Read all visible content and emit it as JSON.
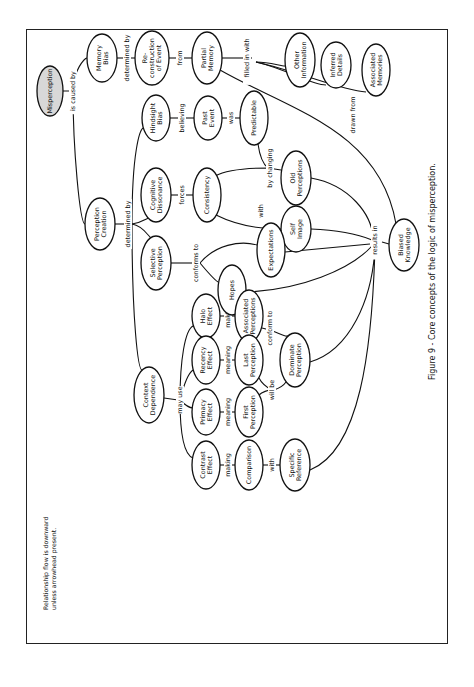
{
  "figure": {
    "caption": "Figure 9 - Core concepts of the logic of misperception.",
    "note_line1": "Relationship flow is downward",
    "note_line2": "unless arrowhead present."
  },
  "colors": {
    "stroke": "#111111",
    "root_fill": "#d8d8d8",
    "node_fill": "#ffffff"
  },
  "nodes": [
    {
      "id": "misperception",
      "lines": [
        "Misperception"
      ],
      "x": 50,
      "y": 91,
      "rx": 13,
      "ry": 25,
      "shaded": true
    },
    {
      "id": "memory-bias",
      "lines": [
        "Memory",
        "Bias"
      ],
      "x": 102,
      "y": 58,
      "rx": 15,
      "ry": 24
    },
    {
      "id": "reconstruction-of-event",
      "lines": [
        "Re-",
        "construction",
        "of Event"
      ],
      "x": 152,
      "y": 58,
      "rx": 17,
      "ry": 27
    },
    {
      "id": "partial-memory",
      "lines": [
        "Partial",
        "Memory"
      ],
      "x": 207,
      "y": 58,
      "rx": 15,
      "ry": 26
    },
    {
      "id": "other-information",
      "lines": [
        "Other",
        "Information"
      ],
      "x": 300,
      "y": 60,
      "rx": 15,
      "ry": 27
    },
    {
      "id": "inferred-details",
      "lines": [
        "Inferred",
        "Details"
      ],
      "x": 336,
      "y": 65,
      "rx": 15,
      "ry": 23
    },
    {
      "id": "associated-memories",
      "lines": [
        "Associated",
        "Memories"
      ],
      "x": 376,
      "y": 70,
      "rx": 14,
      "ry": 26
    },
    {
      "id": "perception-creation",
      "lines": [
        "Perception",
        "Creation"
      ],
      "x": 100,
      "y": 224,
      "rx": 15,
      "ry": 26
    },
    {
      "id": "hindsight-bias",
      "lines": [
        "Hindsight",
        "Bias"
      ],
      "x": 156,
      "y": 118,
      "rx": 14,
      "ry": 23
    },
    {
      "id": "past-event",
      "lines": [
        "Past",
        "Event"
      ],
      "x": 208,
      "y": 118,
      "rx": 14,
      "ry": 22
    },
    {
      "id": "predictable",
      "lines": [
        "Predictable"
      ],
      "x": 254,
      "y": 118,
      "rx": 14,
      "ry": 27
    },
    {
      "id": "cognitive-dissonance",
      "lines": [
        "Cognitive",
        "Dissonance"
      ],
      "x": 156,
      "y": 195,
      "rx": 15,
      "ry": 27
    },
    {
      "id": "consistency",
      "lines": [
        "Consistency"
      ],
      "x": 207,
      "y": 195,
      "rx": 14,
      "ry": 27
    },
    {
      "id": "old-perceptions",
      "lines": [
        "Old",
        "Perceptions"
      ],
      "x": 296,
      "y": 178,
      "rx": 15,
      "ry": 27
    },
    {
      "id": "self-image",
      "lines": [
        "Self",
        "Image"
      ],
      "x": 296,
      "y": 229,
      "rx": 15,
      "ry": 23
    },
    {
      "id": "selective-perception",
      "lines": [
        "Selective",
        "Perception"
      ],
      "x": 156,
      "y": 263,
      "rx": 15,
      "ry": 27
    },
    {
      "id": "expectations",
      "lines": [
        "Expectations"
      ],
      "x": 271,
      "y": 250,
      "rx": 14,
      "ry": 27
    },
    {
      "id": "hopes",
      "lines": [
        "Hopes"
      ],
      "x": 232,
      "y": 290,
      "rx": 14,
      "ry": 25
    },
    {
      "id": "biased-knowledge",
      "lines": [
        "Biased",
        "Knowledge"
      ],
      "x": 404,
      "y": 245,
      "rx": 15,
      "ry": 26
    },
    {
      "id": "halo-effect",
      "lines": [
        "Halo",
        "Effect"
      ],
      "x": 206,
      "y": 316,
      "rx": 14,
      "ry": 22
    },
    {
      "id": "associated-perceptions",
      "lines": [
        "Associated",
        "Perceptions"
      ],
      "x": 249,
      "y": 316,
      "rx": 14,
      "ry": 26
    },
    {
      "id": "recency-effect",
      "lines": [
        "Recency",
        "Effect"
      ],
      "x": 206,
      "y": 360,
      "rx": 14,
      "ry": 24
    },
    {
      "id": "last-perception",
      "lines": [
        "Last",
        "Perception"
      ],
      "x": 249,
      "y": 360,
      "rx": 14,
      "ry": 25
    },
    {
      "id": "dominate-perception",
      "lines": [
        "Dominate",
        "Perception"
      ],
      "x": 295,
      "y": 360,
      "rx": 15,
      "ry": 27
    },
    {
      "id": "context-dependence",
      "lines": [
        "Context",
        "Dependence"
      ],
      "x": 149,
      "y": 395,
      "rx": 15,
      "ry": 28
    },
    {
      "id": "primacy-effect",
      "lines": [
        "Primacy",
        "Effect"
      ],
      "x": 206,
      "y": 412,
      "rx": 14,
      "ry": 23
    },
    {
      "id": "first-perception",
      "lines": [
        "First",
        "Perception"
      ],
      "x": 249,
      "y": 412,
      "rx": 14,
      "ry": 25
    },
    {
      "id": "contrast-effect",
      "lines": [
        "Contrast",
        "Effect"
      ],
      "x": 206,
      "y": 465,
      "rx": 14,
      "ry": 24
    },
    {
      "id": "comparison",
      "lines": [
        "Comparison"
      ],
      "x": 249,
      "y": 465,
      "rx": 14,
      "ry": 25
    },
    {
      "id": "specific-reference",
      "lines": [
        "Specific",
        "Reference"
      ],
      "x": 295,
      "y": 465,
      "rx": 15,
      "ry": 26
    }
  ],
  "edge_labels": [
    {
      "id": "is-caused-by",
      "text": "is caused by",
      "x": 73,
      "y": 91
    },
    {
      "id": "determined-by-memory",
      "text": "determined by",
      "x": 127,
      "y": 58
    },
    {
      "id": "from",
      "text": "from",
      "x": 180,
      "y": 58
    },
    {
      "id": "filled-in-with",
      "text": "filled in with",
      "x": 247,
      "y": 58
    },
    {
      "id": "determined-by-perception",
      "text": "determined by",
      "x": 128,
      "y": 224
    },
    {
      "id": "believing",
      "text": "believing",
      "x": 182,
      "y": 118
    },
    {
      "id": "was",
      "text": "was",
      "x": 231,
      "y": 118
    },
    {
      "id": "forces",
      "text": "forces",
      "x": 182,
      "y": 195
    },
    {
      "id": "by-changing",
      "text": "by changing",
      "x": 270,
      "y": 168
    },
    {
      "id": "with-self",
      "text": "with",
      "x": 261,
      "y": 211
    },
    {
      "id": "drawn-from",
      "text": "drawn from",
      "x": 353,
      "y": 115
    },
    {
      "id": "results-in",
      "text": "results in",
      "x": 375,
      "y": 240
    },
    {
      "id": "conforms-to",
      "text": "conforms to",
      "x": 196,
      "y": 263
    },
    {
      "id": "making-halo",
      "text": "making",
      "x": 228,
      "y": 316
    },
    {
      "id": "conform-to",
      "text": "conform to",
      "x": 270,
      "y": 328
    },
    {
      "id": "meaning-recency",
      "text": "meaning",
      "x": 228,
      "y": 360
    },
    {
      "id": "will-be",
      "text": "will be",
      "x": 272,
      "y": 390
    },
    {
      "id": "may-use",
      "text": "may use",
      "x": 180,
      "y": 400
    },
    {
      "id": "meaning-primacy",
      "text": "meaning",
      "x": 228,
      "y": 412
    },
    {
      "id": "making-contrast",
      "text": "making",
      "x": 228,
      "y": 465
    },
    {
      "id": "with-comparison",
      "text": "with",
      "x": 272,
      "y": 465
    }
  ]
}
